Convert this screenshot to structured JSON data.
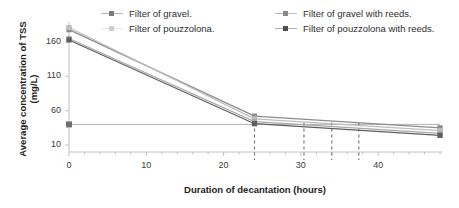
{
  "chart_data": {
    "type": "line",
    "title": "",
    "xlabel": "Duration of decantation (hours)",
    "ylabel": "Average concentration of TSS (mg/L)",
    "ylabel_line1": "Average concentration of TSS",
    "ylabel_line2": "(mg/L)",
    "xlim": [
      0,
      48
    ],
    "ylim": [
      0,
      190
    ],
    "xticks": [
      0,
      10,
      20,
      30,
      40
    ],
    "yticks": [
      10,
      60,
      110,
      160
    ],
    "grid": false,
    "legend_position": "top",
    "x": [
      0,
      24,
      48
    ],
    "series": [
      {
        "name": "Filter of gravel.",
        "color": "#8c8c8c",
        "marker": "square",
        "values": [
          178,
          52,
          35
        ]
      },
      {
        "name": "Filter of pouzzolana.",
        "color": "#bdbdbd",
        "marker": "square",
        "values": [
          181,
          48,
          31
        ]
      },
      {
        "name": "Filter of gravel with reeds.",
        "color": "#a8a8a8",
        "marker": "square",
        "values": [
          165,
          44,
          27
        ]
      },
      {
        "name": "Filter of pouzzolona with reeds.",
        "color": "#5e5e5e",
        "marker": "square",
        "values": [
          163,
          41,
          24
        ]
      }
    ],
    "reference_line": {
      "name": "discharge-limit",
      "orientation": "horizontal",
      "value": 40,
      "color": "#b5b5b5"
    },
    "vertical_markers": [
      {
        "label": "24",
        "value": 24
      },
      {
        "label": "30",
        "value": 30.4
      },
      {
        "label": "34",
        "value": 34
      },
      {
        "label": "37",
        "value": 37.5
      }
    ],
    "tick_labels_x": [
      "0",
      "10",
      "20",
      "30",
      "40"
    ],
    "tick_labels_y": [
      "10",
      "60",
      "110",
      "160"
    ]
  },
  "legend": {
    "column_left": [
      {
        "label": "Filter of gravel.",
        "color": "#8c8c8c"
      },
      {
        "label": "Filter of pouzzolona.",
        "color": "#c9c9c9"
      }
    ],
    "column_right": [
      {
        "label": "Filter of gravel with reeds.",
        "color": "#a0a0a0"
      },
      {
        "label": "Filter of pouzzolona with reeds.",
        "color": "#5e5e5e"
      }
    ]
  }
}
